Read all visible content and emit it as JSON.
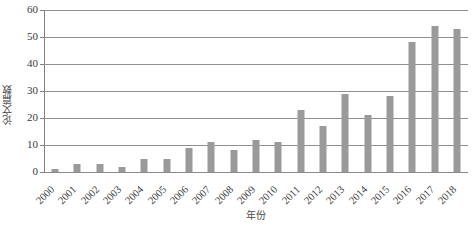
{
  "chart_data": {
    "type": "bar",
    "title": "",
    "xlabel": "年份",
    "ylabel": "论文篇数",
    "categories": [
      "2000",
      "2001",
      "2002",
      "2003",
      "2004",
      "2005",
      "2006",
      "2007",
      "2008",
      "2009",
      "2010",
      "2011",
      "2012",
      "2013",
      "2014",
      "2015",
      "2016",
      "2017",
      "2018"
    ],
    "values": [
      1,
      3,
      3,
      2,
      5,
      5,
      9,
      11,
      8,
      12,
      11,
      23,
      17,
      29,
      21,
      28,
      48,
      54,
      53
    ],
    "ylim": [
      0,
      60
    ],
    "yticks": [
      0,
      10,
      20,
      30,
      40,
      50,
      60
    ],
    "ytick_labels": [
      "0",
      "10",
      "20",
      "30",
      "40",
      "50",
      "60"
    ],
    "grid": true,
    "grid_axis": "y",
    "legend": false,
    "legend_position": "none",
    "bar_color": "#9a9a9a",
    "grid_color": "#909090",
    "axis_color": "#808080",
    "text_color": "#3a3a3a"
  }
}
